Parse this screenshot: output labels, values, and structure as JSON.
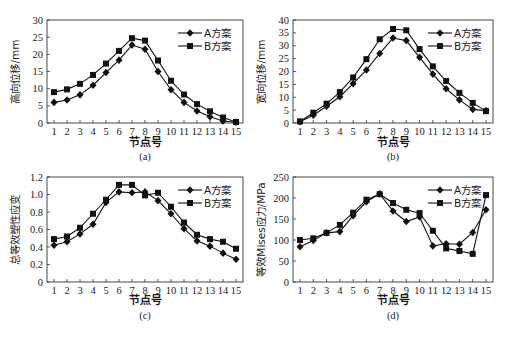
{
  "chart_data": [
    {
      "id": "a",
      "type": "line",
      "caption": "(a)",
      "xlabel": "节点号",
      "ylabel": "高向位移/mm",
      "x": [
        1,
        2,
        3,
        4,
        5,
        6,
        7,
        8,
        9,
        10,
        11,
        12,
        13,
        14,
        15
      ],
      "ylim": [
        0,
        30
      ],
      "yticks": [
        0,
        5,
        10,
        15,
        20,
        25,
        30
      ],
      "grid": false,
      "legend_position": "upper right",
      "series": [
        {
          "name": "A方案",
          "marker": "diamond",
          "values": [
            6.0,
            6.7,
            8.2,
            11.0,
            14.7,
            18.3,
            22.7,
            21.5,
            15.0,
            9.7,
            6.0,
            3.5,
            1.8,
            0.6,
            0.2
          ]
        },
        {
          "name": "B方案",
          "marker": "square",
          "values": [
            9.0,
            9.8,
            11.4,
            14.0,
            17.3,
            21.0,
            24.7,
            24.0,
            18.2,
            12.3,
            8.3,
            5.5,
            3.4,
            1.6,
            0.3
          ]
        }
      ]
    },
    {
      "id": "b",
      "type": "line",
      "caption": "(b)",
      "xlabel": "节点号",
      "ylabel": "宽向位移/mm",
      "x": [
        1,
        2,
        3,
        4,
        5,
        6,
        7,
        8,
        9,
        10,
        11,
        12,
        13,
        14,
        15
      ],
      "ylim": [
        0,
        40
      ],
      "yticks": [
        0,
        5,
        10,
        15,
        20,
        25,
        30,
        35,
        40
      ],
      "grid": false,
      "legend_position": "upper right",
      "series": [
        {
          "name": "A方案",
          "marker": "diamond",
          "values": [
            0.5,
            3.0,
            6.5,
            10.2,
            15.3,
            20.6,
            27.0,
            33.0,
            32.0,
            25.5,
            19.0,
            13.3,
            9.0,
            5.3,
            4.8
          ]
        },
        {
          "name": "B方案",
          "marker": "square",
          "values": [
            0.6,
            4.0,
            7.5,
            12.0,
            17.7,
            24.8,
            32.5,
            36.5,
            36.0,
            28.7,
            22.0,
            16.3,
            11.7,
            7.8,
            4.6
          ]
        }
      ]
    },
    {
      "id": "c",
      "type": "line",
      "caption": "(c)",
      "xlabel": "节点号",
      "ylabel": "总等效塑性应变",
      "x": [
        1,
        2,
        3,
        4,
        5,
        6,
        7,
        8,
        9,
        10,
        11,
        12,
        13,
        14,
        15
      ],
      "ylim": [
        0,
        1.2
      ],
      "yticks": [
        "0",
        "0.2",
        "0.4",
        "0.6",
        "0.8",
        "1.0",
        "1.2"
      ],
      "ytick_values": [
        0,
        0.2,
        0.4,
        0.6,
        0.8,
        1.0,
        1.2
      ],
      "grid": false,
      "legend_position": "upper right",
      "series": [
        {
          "name": "A方案",
          "marker": "diamond",
          "values": [
            0.42,
            0.46,
            0.55,
            0.66,
            0.91,
            1.03,
            1.02,
            1.03,
            0.93,
            0.78,
            0.61,
            0.47,
            0.41,
            0.33,
            0.26
          ]
        },
        {
          "name": "B方案",
          "marker": "square",
          "values": [
            0.49,
            0.52,
            0.62,
            0.78,
            0.94,
            1.11,
            1.11,
            0.99,
            1.02,
            0.86,
            0.68,
            0.54,
            0.49,
            0.46,
            0.38
          ]
        }
      ]
    },
    {
      "id": "d",
      "type": "line",
      "caption": "(d)",
      "xlabel": "节点号",
      "ylabel": "等效Mises应力/MPa",
      "x": [
        1,
        2,
        3,
        4,
        5,
        6,
        7,
        8,
        9,
        10,
        11,
        12,
        13,
        14,
        15
      ],
      "ylim": [
        0,
        250
      ],
      "yticks": [
        0,
        50,
        100,
        150,
        200,
        250
      ],
      "grid": false,
      "legend_position": "upper right",
      "series": [
        {
          "name": "A方案",
          "marker": "diamond",
          "values": [
            84,
            99,
            117,
            120,
            158,
            191,
            210,
            169,
            144,
            155,
            86,
            91,
            90,
            118,
            172
          ]
        },
        {
          "name": "B方案",
          "marker": "square",
          "values": [
            100,
            104,
            117,
            136,
            165,
            196,
            209,
            188,
            172,
            164,
            122,
            80,
            74,
            67,
            207
          ]
        }
      ]
    }
  ]
}
